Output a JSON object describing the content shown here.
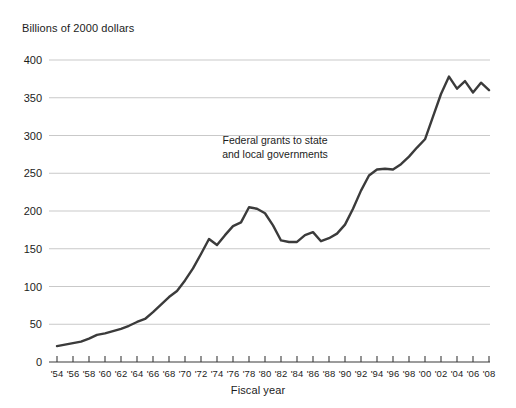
{
  "chart_data": {
    "type": "line",
    "title": "",
    "ylabel": "Billions of 2000 dollars",
    "xlabel": "Fiscal year",
    "annotation": "Federal grants to state and local governments",
    "annotation_line1": "Federal grants to state",
    "annotation_line2": "and local governments",
    "grid": true,
    "legend": "none",
    "line_color": "#3b3b3b",
    "grid_color": "#c9c9c9",
    "axis_color": "#3b3b3b",
    "ylim": [
      0,
      400
    ],
    "xlim": [
      1954,
      2008
    ],
    "ytick_labels": [
      "400",
      "350",
      "300",
      "250",
      "200",
      "150",
      "100",
      "50",
      "0"
    ],
    "ytick_values": [
      400,
      350,
      300,
      250,
      200,
      150,
      100,
      50,
      0
    ],
    "xtick_labels": [
      "'54",
      "'56",
      "'58",
      "'60",
      "'62",
      "'64",
      "'66",
      "'68",
      "'70",
      "'72",
      "'74",
      "'76",
      "'78",
      "'80",
      "'82",
      "'84",
      "'86",
      "'88",
      "'90",
      "'92",
      "'94",
      "'96",
      "'98",
      "'00",
      "'02",
      "'04",
      "'06",
      "'08"
    ],
    "xtick_values": [
      1954,
      1956,
      1958,
      1960,
      1962,
      1964,
      1966,
      1968,
      1970,
      1972,
      1974,
      1976,
      1978,
      1980,
      1982,
      1984,
      1986,
      1988,
      1990,
      1992,
      1994,
      1996,
      1998,
      2000,
      2002,
      2004,
      2006,
      2008
    ],
    "x": [
      1954,
      1955,
      1956,
      1957,
      1958,
      1959,
      1960,
      1961,
      1962,
      1963,
      1964,
      1965,
      1966,
      1967,
      1968,
      1969,
      1970,
      1971,
      1972,
      1973,
      1974,
      1975,
      1976,
      1977,
      1978,
      1979,
      1980,
      1981,
      1982,
      1983,
      1984,
      1985,
      1986,
      1987,
      1988,
      1989,
      1990,
      1991,
      1992,
      1993,
      1994,
      1995,
      1996,
      1997,
      1998,
      1999,
      2000,
      2001,
      2002,
      2003,
      2004,
      2005,
      2006,
      2007,
      2008
    ],
    "values": [
      21,
      23,
      25,
      27,
      31,
      36,
      38,
      41,
      44,
      48,
      53,
      57,
      66,
      76,
      86,
      94,
      108,
      124,
      143,
      163,
      155,
      168,
      180,
      185,
      205,
      203,
      197,
      181,
      161,
      159,
      159,
      168,
      172,
      160,
      164,
      170,
      182,
      203,
      227,
      247,
      255,
      256,
      255,
      262,
      272,
      284,
      295,
      325,
      355,
      378,
      362,
      372,
      357,
      370,
      360
    ],
    "series_name": "Federal grants to state and local governments",
    "units": "Billions of 2000 dollars",
    "source_note": ""
  }
}
